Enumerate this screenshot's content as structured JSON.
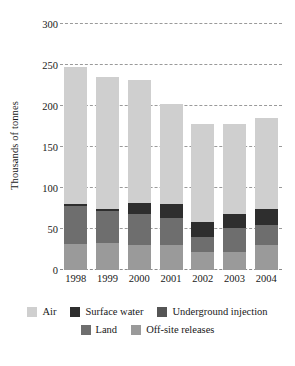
{
  "chart_data": {
    "type": "bar",
    "subtype": "stacked-bar",
    "title": "",
    "xlabel": "",
    "ylabel": "Thousands of tonnes",
    "categories": [
      "1998",
      "1999",
      "2000",
      "2001",
      "2002",
      "2003",
      "2004"
    ],
    "ylim": [
      0,
      300
    ],
    "yticks": [
      0,
      50,
      100,
      150,
      200,
      250,
      300
    ],
    "ytick_labels": [
      "0",
      "50",
      "100",
      "150",
      "200",
      "250",
      "300"
    ],
    "grid": true,
    "grid_style": "dashed horizontal",
    "legend_position": "bottom",
    "stack_order_bottom_to_top": [
      "Off-site releases",
      "Land",
      "Underground injection",
      "Surface water",
      "Air"
    ],
    "series": [
      {
        "name": "Air",
        "color": "#cfcfcf",
        "values": [
          168,
          161,
          150,
          122,
          119,
          110,
          111
        ]
      },
      {
        "name": "Surface water",
        "color": "#2e2e2e",
        "values": [
          2,
          3,
          14,
          17,
          19,
          17,
          19
        ]
      },
      {
        "name": "Underground injection",
        "color": "#555555",
        "values": [
          0,
          0,
          0,
          0,
          0,
          0,
          0
        ]
      },
      {
        "name": "Land",
        "color": "#6e6e6e",
        "values": [
          46,
          39,
          38,
          32,
          18,
          29,
          24
        ]
      },
      {
        "name": "Off-site releases",
        "color": "#9a9a9a",
        "values": [
          32,
          33,
          30,
          31,
          22,
          22,
          31
        ]
      }
    ],
    "totals": [
      248,
      236,
      232,
      202,
      178,
      178,
      185
    ]
  },
  "legend": {
    "row1": [
      {
        "label": "Air",
        "color": "#cfcfcf"
      },
      {
        "label": "Surface water",
        "color": "#2e2e2e"
      },
      {
        "label": "Underground injection",
        "color": "#555555"
      }
    ],
    "row2": [
      {
        "label": "Land",
        "color": "#6e6e6e"
      },
      {
        "label": "Off-site releases",
        "color": "#9a9a9a"
      }
    ]
  },
  "axis": {
    "y_title": "Thousands of tonnes"
  },
  "colors": {
    "background": "#ffffff",
    "text": "#181818",
    "gridline": "#9a9a9a"
  }
}
